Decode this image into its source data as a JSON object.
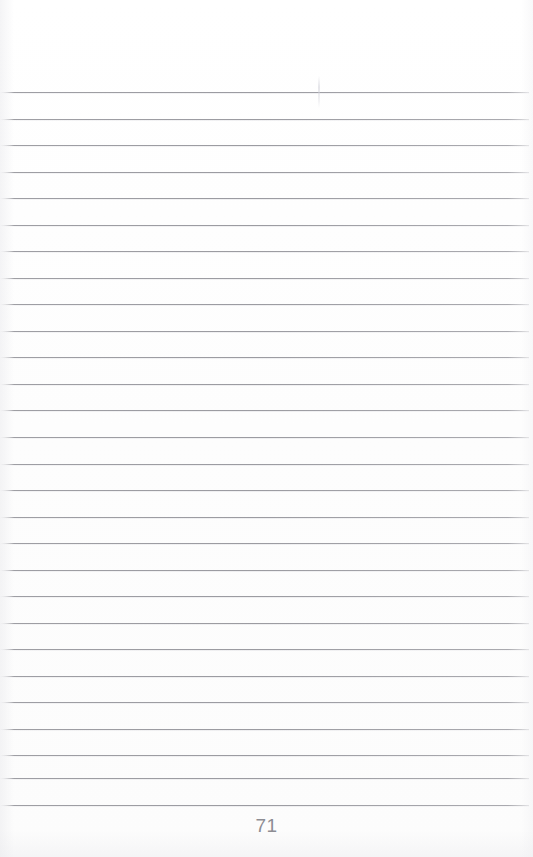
{
  "document": {
    "kind": "scanned-notebook-page",
    "page_number": "71",
    "page_width": 533,
    "page_height": 857,
    "background_color": "#fefefe",
    "content_text": ""
  },
  "ruling": {
    "line_color": "#96969c",
    "line_count": 28,
    "first_line_y": 92,
    "line_spacing": 26.5,
    "line_left": 0,
    "line_right": 529,
    "lines": [
      {
        "index": 1,
        "y": 92,
        "text": ""
      },
      {
        "index": 2,
        "y": 119,
        "text": ""
      },
      {
        "index": 3,
        "y": 145,
        "text": ""
      },
      {
        "index": 4,
        "y": 172,
        "text": ""
      },
      {
        "index": 5,
        "y": 198,
        "text": ""
      },
      {
        "index": 6,
        "y": 225,
        "text": ""
      },
      {
        "index": 7,
        "y": 251,
        "text": ""
      },
      {
        "index": 8,
        "y": 278,
        "text": ""
      },
      {
        "index": 9,
        "y": 304,
        "text": ""
      },
      {
        "index": 10,
        "y": 331,
        "text": ""
      },
      {
        "index": 11,
        "y": 357,
        "text": ""
      },
      {
        "index": 12,
        "y": 384,
        "text": ""
      },
      {
        "index": 13,
        "y": 410,
        "text": ""
      },
      {
        "index": 14,
        "y": 437,
        "text": ""
      },
      {
        "index": 15,
        "y": 464,
        "text": ""
      },
      {
        "index": 16,
        "y": 490,
        "text": ""
      },
      {
        "index": 17,
        "y": 517,
        "text": ""
      },
      {
        "index": 18,
        "y": 543,
        "text": ""
      },
      {
        "index": 19,
        "y": 570,
        "text": ""
      },
      {
        "index": 20,
        "y": 596,
        "text": ""
      },
      {
        "index": 21,
        "y": 623,
        "text": ""
      },
      {
        "index": 22,
        "y": 649,
        "text": ""
      },
      {
        "index": 23,
        "y": 676,
        "text": ""
      },
      {
        "index": 24,
        "y": 702,
        "text": ""
      },
      {
        "index": 25,
        "y": 729,
        "text": ""
      },
      {
        "index": 26,
        "y": 755,
        "text": ""
      },
      {
        "index": 27,
        "y": 778,
        "text": ""
      },
      {
        "index": 28,
        "y": 805,
        "text": ""
      }
    ]
  },
  "artifacts": {
    "vertical_scan_mark": {
      "x": 318,
      "y": 76,
      "width": 2,
      "height": 32
    }
  },
  "footer": {
    "page_number_label": "71",
    "page_number_color": "#8d8d93"
  }
}
